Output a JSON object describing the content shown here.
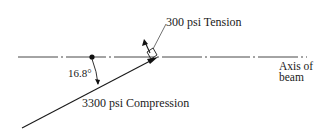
{
  "diagram": {
    "labels": {
      "tension": "300 psi Tension",
      "axis_line1": "Axis of",
      "axis_line2": "beam",
      "angle": "16.8°",
      "compression": "3300 psi Compression"
    },
    "values": {
      "tension_stress_psi": 300,
      "compression_stress_psi": 3300,
      "angle_deg": 16.8
    },
    "colors": {
      "line": "#1a1a1a",
      "background": "#ffffff"
    }
  }
}
